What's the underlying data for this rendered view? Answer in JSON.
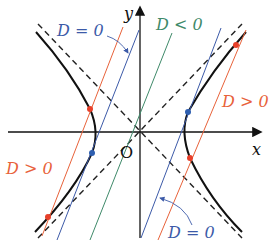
{
  "figure": {
    "axes": {
      "x_label": "x",
      "y_label": "y",
      "origin_label": "O"
    },
    "labels": {
      "d_zero_top": "D = 0",
      "d_negative": "D < 0",
      "d_positive_right": "D > 0",
      "d_positive_left": "D > 0",
      "d_zero_bottom": "D = 0"
    },
    "colors": {
      "hyperbola": "#111111",
      "asymptote": "#222222",
      "d_positive": "#e8623a",
      "d_zero": "#3c5aa8",
      "d_negative": "#3f8a6a",
      "intersection_red": "#e8402a",
      "tangent_blue": "#2f5fb0"
    }
  }
}
